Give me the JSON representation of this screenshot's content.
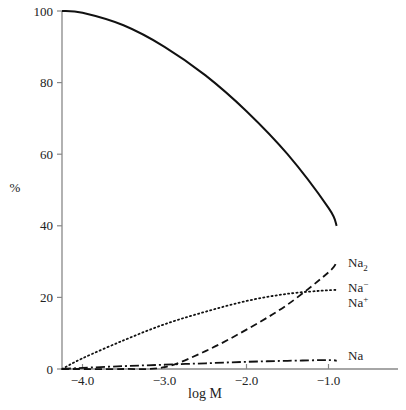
{
  "chart_data": {
    "type": "line",
    "title": "",
    "xlabel": "log M",
    "ylabel": "%",
    "xlim": [
      -4.25,
      -0.2
    ],
    "ylim": [
      0,
      100
    ],
    "x_ticks": [
      -4.0,
      -3.0,
      -2.0,
      -1.0
    ],
    "x_tick_labels": [
      "−4.0",
      "−3.0",
      "−2.0",
      "−1.0"
    ],
    "y_ticks": [
      0,
      20,
      40,
      60,
      80,
      100
    ],
    "y_tick_labels": [
      "0",
      "20",
      "40",
      "60",
      "80",
      "100"
    ],
    "grid": false,
    "legend": "inline labels at right end of each curve",
    "series": [
      {
        "name": "Na+",
        "label_main": "Na",
        "label_sup": "+",
        "label_sub": "",
        "style": "solid",
        "x": [
          -4.25,
          -4.0,
          -3.5,
          -3.0,
          -2.5,
          -2.0,
          -1.5,
          -1.0,
          -0.9
        ],
        "values": [
          100,
          99.5,
          96,
          90,
          82,
          72,
          60,
          45,
          40
        ]
      },
      {
        "name": "Na2",
        "label_main": "Na",
        "label_sup": "",
        "label_sub": "2",
        "style": "dashed",
        "x": [
          -4.25,
          -4.0,
          -3.5,
          -3.0,
          -2.5,
          -2.0,
          -1.5,
          -1.0,
          -0.9
        ],
        "values": [
          0,
          0,
          0,
          0.5,
          5,
          11,
          18,
          27,
          30
        ]
      },
      {
        "name": "Na-",
        "label_main": "Na",
        "label_sup": "−",
        "label_sub": "",
        "style": "dotted",
        "x": [
          -4.25,
          -4.0,
          -3.5,
          -3.0,
          -2.5,
          -2.0,
          -1.5,
          -1.0,
          -0.9
        ],
        "values": [
          0,
          3,
          8,
          12.5,
          16,
          19,
          21,
          22,
          22
        ]
      },
      {
        "name": "Na",
        "label_main": "Na",
        "label_sup": "",
        "label_sub": "",
        "style": "dashdot",
        "x": [
          -4.25,
          -4.0,
          -3.5,
          -3.0,
          -2.5,
          -2.0,
          -1.5,
          -1.0,
          -0.9
        ],
        "values": [
          0,
          0.3,
          0.8,
          1.2,
          1.6,
          2.0,
          2.3,
          2.5,
          2.3
        ]
      }
    ]
  }
}
